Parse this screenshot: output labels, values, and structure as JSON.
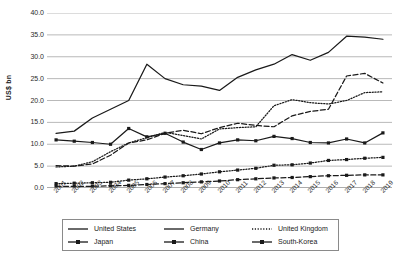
{
  "chart_data": {
    "type": "line",
    "title": "",
    "xlabel": "",
    "ylabel": "US$ bn",
    "ylim": [
      0,
      40
    ],
    "ytick_step": 5,
    "ytick_labels": [
      "40.0",
      "35.0",
      "30.0",
      "25.0",
      "20.0",
      "15.0",
      "10.0",
      "5.0",
      "0.0"
    ],
    "grid": true,
    "legend_position": "bottom",
    "x": [
      2001,
      2002,
      2003,
      2004,
      2005,
      2006,
      2007,
      2008,
      2009,
      2010,
      2011,
      2012,
      2013,
      2014,
      2015,
      2016,
      2017,
      2018,
      2019
    ],
    "categories": [
      "2001",
      "2002",
      "2003",
      "2004",
      "2005",
      "2006",
      "2007",
      "2008",
      "2009",
      "2010",
      "2011",
      "2012",
      "2013",
      "2014",
      "2015",
      "2016",
      "2017",
      "2018",
      "2019"
    ],
    "series": [
      {
        "name": "United States",
        "style": "solid",
        "marker": "none",
        "color": "#1a1a1a",
        "values": [
          12.5,
          13.0,
          16.0,
          18.0,
          20.0,
          28.3,
          25.0,
          23.6,
          23.3,
          22.3,
          25.3,
          27.0,
          28.3,
          30.5,
          29.2,
          31.0,
          34.7,
          34.5,
          34.0
        ]
      },
      {
        "name": "Germany",
        "style": "dashed",
        "marker": "none",
        "color": "#1a1a1a",
        "values": [
          5.1,
          5.0,
          5.5,
          7.5,
          10.3,
          11.0,
          12.5,
          13.2,
          12.4,
          13.8,
          14.8,
          14.3,
          14.0,
          16.5,
          17.5,
          18.0,
          25.6,
          26.2,
          24.0
        ]
      },
      {
        "name": "United Kingdom",
        "style": "dotted",
        "marker": "none",
        "color": "#1a1a1a",
        "values": [
          4.8,
          5.0,
          6.0,
          8.3,
          10.3,
          11.5,
          12.7,
          12.0,
          11.2,
          13.5,
          13.8,
          14.0,
          18.8,
          20.2,
          19.5,
          19.2,
          20.0,
          21.8,
          22.0
        ]
      },
      {
        "name": "Japan",
        "style": "solid",
        "marker": "square",
        "color": "#1a1a1a",
        "values": [
          11.0,
          10.7,
          10.4,
          10.0,
          13.6,
          11.7,
          12.5,
          10.5,
          8.8,
          10.3,
          11.0,
          10.8,
          11.8,
          11.3,
          10.4,
          10.3,
          11.2,
          10.3,
          12.6
        ]
      },
      {
        "name": "China",
        "style": "dotted",
        "marker": "square",
        "color": "#1a1a1a",
        "values": [
          1.0,
          1.1,
          1.2,
          1.3,
          1.8,
          2.1,
          2.5,
          2.8,
          3.2,
          3.7,
          4.1,
          4.5,
          5.2,
          5.3,
          5.7,
          6.3,
          6.5,
          6.8,
          7.0
        ]
      },
      {
        "name": "South-Korea",
        "style": "dashed",
        "marker": "square",
        "color": "#1a1a1a",
        "values": [
          0.4,
          0.4,
          0.4,
          0.5,
          0.6,
          0.8,
          1.0,
          1.2,
          1.4,
          1.6,
          1.9,
          2.1,
          2.3,
          2.4,
          2.6,
          2.8,
          2.9,
          3.0,
          3.0
        ]
      }
    ]
  },
  "legend": {
    "items": [
      {
        "label": "United States",
        "style": "solid",
        "marker": "none"
      },
      {
        "label": "Germany",
        "style": "solid",
        "marker": "none"
      },
      {
        "label": "United Kingdom",
        "style": "dotted",
        "marker": "none"
      },
      {
        "label": "Japan",
        "style": "solid",
        "marker": "square"
      },
      {
        "label": "China",
        "style": "solid",
        "marker": "square"
      },
      {
        "label": "South-Korea",
        "style": "solid",
        "marker": "square"
      }
    ]
  },
  "colors": {
    "line": "#1a1a1a",
    "grid": "#b9b9b9",
    "text": "#2b2b2b",
    "legend_border": "#8a8a8a",
    "background": "#ffffff"
  }
}
